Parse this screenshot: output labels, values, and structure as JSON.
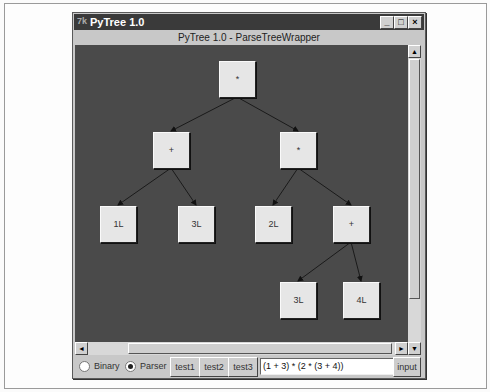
{
  "window": {
    "title": "PyTree 1.0",
    "subtitle": "PyTree 1.0 - ParseTreeWrapper",
    "controls": {
      "minimize": "_",
      "maximize": "□",
      "close": "×"
    }
  },
  "tree": {
    "nodes": [
      {
        "id": "root",
        "label": "*",
        "x": 144,
        "y": 16
      },
      {
        "id": "plus1",
        "label": "+",
        "x": 78,
        "y": 87
      },
      {
        "id": "mul1",
        "label": "*",
        "x": 205,
        "y": 87
      },
      {
        "id": "l1",
        "label": "1L",
        "x": 25,
        "y": 161
      },
      {
        "id": "l3a",
        "label": "3L",
        "x": 103,
        "y": 161
      },
      {
        "id": "l2",
        "label": "2L",
        "x": 180,
        "y": 161
      },
      {
        "id": "plus2",
        "label": "+",
        "x": 258,
        "y": 161
      },
      {
        "id": "l3b",
        "label": "3L",
        "x": 205,
        "y": 237
      },
      {
        "id": "l4",
        "label": "4L",
        "x": 268,
        "y": 237
      }
    ]
  },
  "controls": {
    "radio_binary": "Binary",
    "radio_parser": "Parser",
    "selected": "Parser",
    "test1": "test1",
    "test2": "test2",
    "test3": "test3",
    "expression": "(1 + 3) * (2 * (3 + 4))",
    "input_button": "input"
  },
  "colors": {
    "canvas": "#4a4a4a",
    "node": "#e6e6e6",
    "titlebar": "#3a3a3a"
  }
}
